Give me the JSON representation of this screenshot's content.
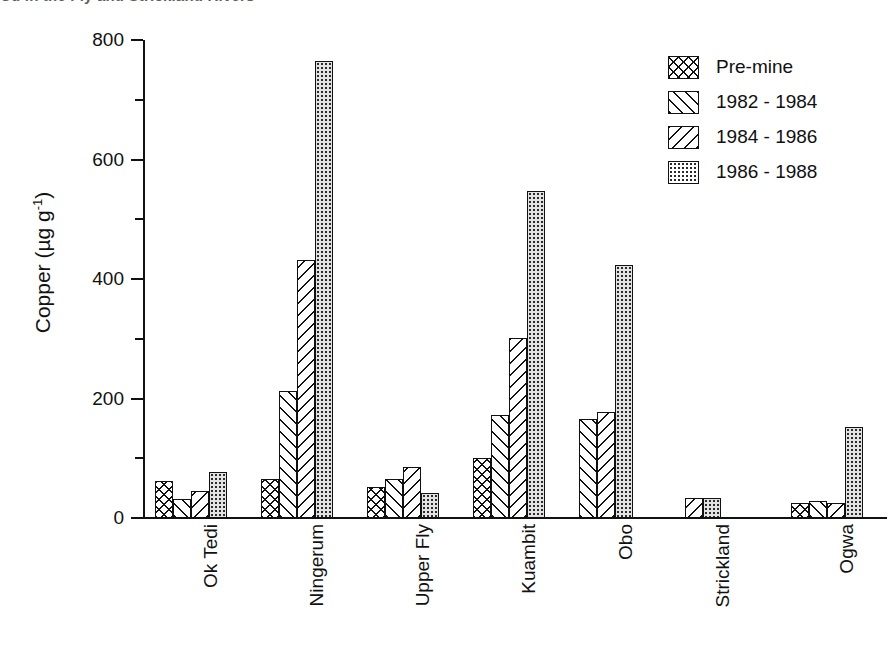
{
  "top_caption": "Cu in the Fly and Strickland Rivers",
  "chart_data": {
    "type": "bar",
    "title": "",
    "xlabel": "",
    "ylabel": "Copper  (µg g",
    "ylabel_sup": "-1",
    "ylabel_tail": ")",
    "ylim": [
      0,
      800
    ],
    "ytick_values": [
      0,
      200,
      400,
      600,
      800
    ],
    "ytick_labels": [
      "0",
      "200",
      "400",
      "600",
      "800"
    ],
    "yminor_values": [
      100,
      300,
      500,
      700
    ],
    "grid": false,
    "legend_position": "top-right",
    "categories": [
      "Ok Tedi",
      "Ningerum",
      "Upper Fly",
      "Kuambit",
      "Obo",
      "Strickland",
      "Ogwa"
    ],
    "series": [
      {
        "name": "Pre-mine",
        "pattern": "crosshatch",
        "values": [
          62,
          65,
          52,
          100,
          null,
          null,
          25
        ]
      },
      {
        "name": "1982 - 1984",
        "pattern": "fwd-diagonal",
        "values": [
          32,
          212,
          66,
          173,
          165,
          null,
          28
        ]
      },
      {
        "name": "1984 - 1986",
        "pattern": "back-diagonal",
        "values": [
          45,
          432,
          85,
          302,
          177,
          33,
          25
        ]
      },
      {
        "name": "1986 - 1988",
        "pattern": "dots",
        "values": [
          77,
          765,
          42,
          547,
          423,
          34,
          152
        ]
      }
    ]
  }
}
